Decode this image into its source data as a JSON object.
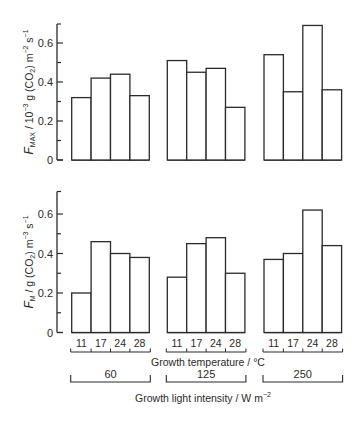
{
  "chart_data": [
    {
      "type": "bar",
      "panel": "top",
      "ylabel": "F_MAX / 10^-3 g (CO2) m^-2 s^-1",
      "ylabel_parts": {
        "main": "F",
        "sub": "MAX",
        "rest": " / 10",
        "exp": "−3",
        "rest2": " g (CO",
        "sub2": "2",
        "rest3": ") m",
        "exp2": "−2",
        "rest4": " s",
        "exp3": "−1"
      },
      "ylim": [
        0,
        0.7
      ],
      "yticks": [
        0,
        0.2,
        0.4,
        0.6
      ],
      "ytick_labels": [
        "0",
        "0.2",
        "0.4",
        "0.6"
      ],
      "groups": [
        "60",
        "125",
        "250"
      ],
      "categories": [
        "11",
        "17",
        "24",
        "28"
      ],
      "series": [
        {
          "name": "60",
          "values": [
            0.32,
            0.42,
            0.44,
            0.33
          ]
        },
        {
          "name": "125",
          "values": [
            0.51,
            0.45,
            0.47,
            0.27
          ]
        },
        {
          "name": "250",
          "values": [
            0.54,
            0.35,
            0.69,
            0.36
          ]
        }
      ],
      "grid": false
    },
    {
      "type": "bar",
      "panel": "bottom",
      "ylabel": "F_M / g (CO2) m^-3 s^-1",
      "ylabel_parts": {
        "main": "F",
        "sub": "M",
        "rest": " / g (CO",
        "sub2": "2",
        "rest2": ") m",
        "exp": "−3",
        "rest3": " s",
        "exp2": "−1"
      },
      "ylim": [
        0,
        0.7
      ],
      "yticks": [
        0,
        0.2,
        0.4,
        0.6
      ],
      "ytick_labels": [
        "0",
        "0.2",
        "0.4",
        "0.6"
      ],
      "groups": [
        "60",
        "125",
        "250"
      ],
      "categories": [
        "11",
        "17",
        "24",
        "28"
      ],
      "series": [
        {
          "name": "60",
          "values": [
            0.2,
            0.46,
            0.4,
            0.38
          ]
        },
        {
          "name": "125",
          "values": [
            0.28,
            0.45,
            0.48,
            0.3
          ]
        },
        {
          "name": "250",
          "values": [
            0.37,
            0.4,
            0.62,
            0.44
          ]
        }
      ],
      "xlabel": "Growth temperature / °C",
      "grid": false
    }
  ],
  "labels": {
    "xlabel_temperature": "Growth temperature / °C",
    "xlabel_light": "Growth light intensity / W m",
    "xlabel_light_exp": "−2",
    "light_groups": [
      "60",
      "125",
      "250"
    ],
    "temperatures": [
      "11",
      "17",
      "24",
      "28"
    ]
  },
  "style": {
    "line_color": "#2a2a2a",
    "bar_fill": "#ffffff",
    "background": "#ffffff"
  }
}
